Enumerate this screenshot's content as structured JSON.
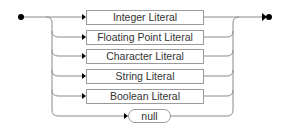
{
  "diagram": {
    "type": "syntax-railroad",
    "alternatives": [
      {
        "label": "Integer Literal",
        "shape": "rect"
      },
      {
        "label": "Floating Point Literal",
        "shape": "rect"
      },
      {
        "label": "Character Literal",
        "shape": "rect"
      },
      {
        "label": "String Literal",
        "shape": "rect"
      },
      {
        "label": "Boolean Literal",
        "shape": "rect"
      },
      {
        "label": "null",
        "shape": "rounded"
      }
    ],
    "colors": {
      "line": "#8a8a8a",
      "box_border": "#9a9a9a",
      "text": "#333333",
      "terminal_dot": "#000000"
    }
  }
}
